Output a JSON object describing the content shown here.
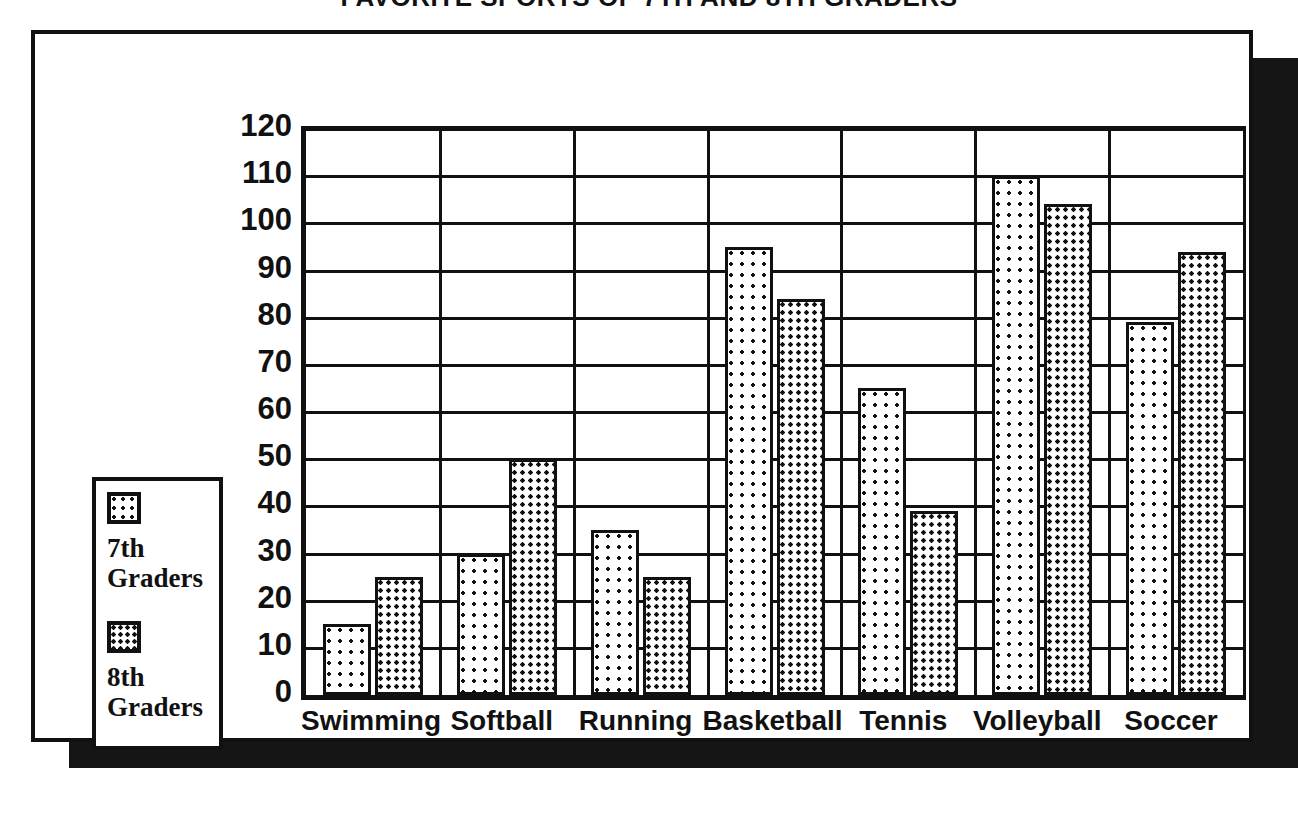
{
  "chart_data": {
    "type": "bar",
    "title": "FAVORITE SPORTS OF 7TH AND 8TH GRADERS",
    "xlabel": "",
    "ylabel": "",
    "ylim": [
      0,
      120
    ],
    "ytick_step": 10,
    "yticks": [
      "120",
      "110",
      "100",
      "90",
      "80",
      "70",
      "60",
      "50",
      "40",
      "30",
      "20",
      "10",
      "0"
    ],
    "grid": true,
    "legend_position": "left-outside",
    "categories": [
      "Swimming",
      "Softball",
      "Running",
      "Basketball",
      "Tennis",
      "Volleyball",
      "Soccer"
    ],
    "series": [
      {
        "name": "7th Graders",
        "pattern": "sparse-dots",
        "values": [
          15,
          30,
          35,
          95,
          65,
          110,
          79
        ]
      },
      {
        "name": "8th Graders",
        "pattern": "dense-dots",
        "values": [
          25,
          50,
          25,
          84,
          39,
          104,
          94
        ]
      }
    ]
  },
  "legend": {
    "items": [
      {
        "label": "7th Graders"
      },
      {
        "label": "8th Graders"
      }
    ]
  },
  "colors": {
    "ink": "#111111",
    "paper": "#ffffff",
    "shadow": "#151515"
  }
}
